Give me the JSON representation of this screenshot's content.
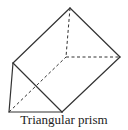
{
  "diagram": {
    "caption": "Triangular prism",
    "stroke_color": "#333333",
    "vertices": {
      "front_top": [
        13,
        63
      ],
      "front_bottom_left": [
        9,
        112
      ],
      "front_bottom_right": [
        62,
        112
      ],
      "back_top": [
        70,
        8
      ],
      "back_bottom_left_hidden": [
        66,
        57
      ],
      "back_bottom_right": [
        120,
        57
      ]
    },
    "solid_edges": [
      [
        "front_top",
        "front_bottom_left"
      ],
      [
        "front_bottom_left",
        "front_bottom_right"
      ],
      [
        "front_top",
        "front_bottom_right"
      ],
      [
        "front_top",
        "back_top"
      ],
      [
        "back_top",
        "back_bottom_right"
      ],
      [
        "front_bottom_right",
        "back_bottom_right"
      ]
    ],
    "dashed_edges": [
      [
        "back_top",
        "back_bottom_left_hidden"
      ],
      [
        "back_bottom_left_hidden",
        "back_bottom_right"
      ],
      [
        "front_bottom_left",
        "back_bottom_left_hidden"
      ]
    ]
  }
}
